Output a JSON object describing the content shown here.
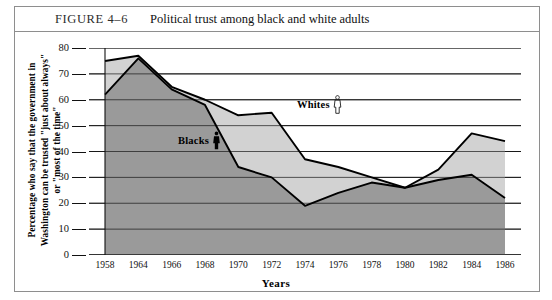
{
  "figure": {
    "number": "FIGURE 4–6",
    "caption": "Political trust among black and white adults"
  },
  "axis": {
    "x_title": "Years",
    "y_title_line1": "Percentage who say that the government in",
    "y_title_line2": "Washington can be trusted \"just about always\"",
    "y_title_line3": "or \"most of the time\""
  },
  "legend": {
    "whites_label": "Whites",
    "blacks_label": "Blacks",
    "whites_icon": "person-outline-icon",
    "blacks_icon": "person-solid-icon"
  },
  "colors": {
    "whites_fill": "#d2d2d2",
    "blacks_fill": "#9a9a9a",
    "line": "#000000",
    "gridline": "#111111",
    "frame": "#8e8e8e"
  },
  "chart_data": {
    "type": "area",
    "title": "Political trust among black and white adults",
    "xlabel": "Years",
    "ylabel": "Percentage who say that the government in Washington can be trusted \"just about always\" or \"most of the time\"",
    "categories": [
      "1958",
      "1964",
      "1966",
      "1968",
      "1970",
      "1972",
      "1974",
      "1976",
      "1978",
      "1980",
      "1982",
      "1984",
      "1986"
    ],
    "ylim": [
      0,
      80
    ],
    "ytick_values": [
      0,
      10,
      20,
      30,
      40,
      50,
      60,
      70,
      80
    ],
    "grid": true,
    "legend_position": "inline-annotation",
    "series": [
      {
        "name": "Whites",
        "values": [
          75,
          77,
          65,
          60,
          54,
          55,
          37,
          34,
          30,
          26,
          33,
          47,
          44
        ]
      },
      {
        "name": "Blacks",
        "values": [
          62,
          76,
          64,
          58,
          34,
          30,
          19,
          24,
          28,
          26,
          29,
          31,
          22
        ]
      }
    ]
  }
}
